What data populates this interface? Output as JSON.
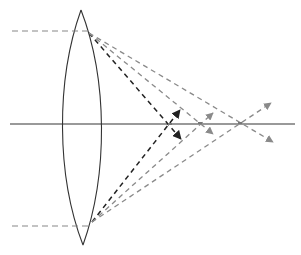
{
  "diagram": {
    "title": "Converging lens with spherical aberration",
    "colors": {
      "background": "#ffffff",
      "lens_outline": "#333333",
      "axis": "#777777",
      "incoming_ray": "#888888",
      "paraxial_ray": "#222222",
      "mid_ray": "#8a8a8a",
      "marginal_ray": "#8a8a8a"
    },
    "optical_axis": {
      "x1": 10,
      "y1": 124,
      "x2": 295,
      "y2": 124
    },
    "lens": {
      "top": [
        81,
        10
      ],
      "bottom": [
        83,
        245
      ],
      "left_bulge_x": 62,
      "right_bulge_x": 102
    },
    "incoming_rays": [
      {
        "id": "top",
        "x1": 12,
        "y1": 31,
        "x2": 89,
        "y2": 31
      },
      {
        "id": "bottom",
        "x1": 12,
        "y1": 226,
        "x2": 92,
        "y2": 226
      }
    ],
    "focal_points": [
      {
        "id": "near-focus",
        "x": 170,
        "y": 124
      },
      {
        "id": "mid-focus",
        "x": 200,
        "y": 123
      },
      {
        "id": "far-focus",
        "x": 240,
        "y": 123
      }
    ],
    "refracted_rays": [
      {
        "group": "near",
        "from": [
          89,
          33
        ],
        "to": [
          181,
          139
        ],
        "color_key": "paraxial_ray"
      },
      {
        "group": "near",
        "from": [
          92,
          222
        ],
        "to": [
          180,
          110
        ],
        "color_key": "paraxial_ray"
      },
      {
        "group": "mid",
        "from": [
          89,
          33
        ],
        "to": [
          213,
          134
        ],
        "color_key": "mid_ray"
      },
      {
        "group": "mid",
        "from": [
          92,
          222
        ],
        "to": [
          213,
          113
        ],
        "color_key": "mid_ray"
      },
      {
        "group": "far",
        "from": [
          89,
          33
        ],
        "to": [
          273,
          142
        ],
        "color_key": "marginal_ray"
      },
      {
        "group": "far",
        "from": [
          92,
          222
        ],
        "to": [
          271,
          103
        ],
        "color_key": "marginal_ray"
      }
    ]
  }
}
